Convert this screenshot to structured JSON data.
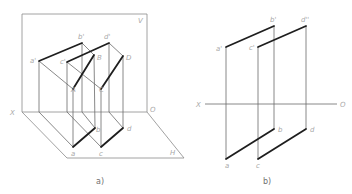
{
  "figure_a": {
    "caption": "a)",
    "planes": {
      "vertical": "V",
      "horizontal": "H"
    },
    "axis": {
      "start": "X",
      "end": "O"
    },
    "labels": {
      "a_prime": "a'",
      "b_prime": "b'",
      "c_prime": "c'",
      "d_prime": "d'",
      "A": "A",
      "B": "B",
      "C": "C",
      "D": "D",
      "a": "a",
      "b": "b",
      "c": "c",
      "d": "d"
    }
  },
  "figure_b": {
    "caption": "b)",
    "axis": {
      "start": "X",
      "end": "O"
    },
    "labels": {
      "a_prime": "a'",
      "b_prime": "b'",
      "c_prime": "c'",
      "d_prime": "d''",
      "a": "a",
      "b": "b",
      "c": "c",
      "d": "d"
    }
  },
  "colors": {
    "thin_line": "#6a6a6a",
    "thick_line": "#1e1e1e",
    "label": "#a8a8a8"
  }
}
